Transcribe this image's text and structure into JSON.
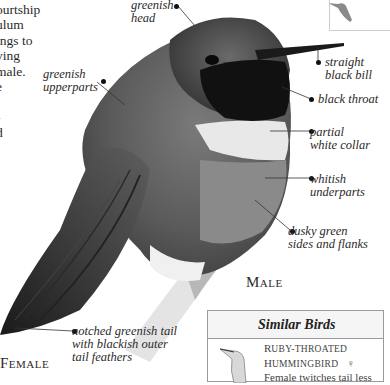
{
  "body_text": {
    "lines": [
      "ourtship",
      "ulum",
      "ings to",
      "ving",
      "male.",
      "e",
      "",
      "-",
      "d"
    ]
  },
  "labels": {
    "greenish_head": "greenish\nhead",
    "greenish_upperparts": "greenish\nupperparts",
    "straight_black_bill": "straight\nblack bill",
    "black_throat": "black throat",
    "partial_white_collar": "partial\nwhite collar",
    "whitish_underparts": "whitish\nunderparts",
    "dusky_green_sides": "dusky green\nsides and flanks",
    "notched_tail": "notched greenish tail\nwith blackish outer\ntail feathers"
  },
  "captions": {
    "male_initial": "M",
    "male_rest": "ALE",
    "female_initial": "F",
    "female_rest": "EMALE"
  },
  "similar_birds": {
    "title": "Similar Birds",
    "species_line1_initial": "R",
    "species_line1_rest": "UBY-THROATED",
    "species_line2_initial": "H",
    "species_line2_rest": "UMMINGBIRD",
    "sex_symbol": "♀",
    "note": "Female twitches tail less"
  },
  "colors": {
    "dark": "#111111",
    "box_border": "#9a9a9a",
    "text": "#2a2a2a"
  }
}
